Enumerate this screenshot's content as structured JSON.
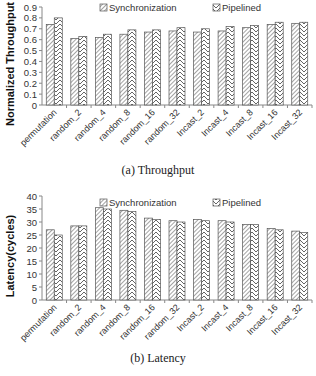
{
  "chart_data": [
    {
      "type": "bar",
      "title": "",
      "caption": "(a) Throughput",
      "xlabel": "",
      "ylabel": "Normalized Throughput",
      "ylim": [
        0,
        0.9
      ],
      "yticks": [
        0,
        0.1,
        0.2,
        0.3,
        0.4,
        0.5,
        0.6,
        0.7,
        0.8,
        0.9
      ],
      "ytick_labels": [
        "0",
        "0.1",
        "0.2",
        "0.3",
        "0.4",
        "0.5",
        "0.6",
        "0.7",
        "0.8",
        "0.9"
      ],
      "grid": false,
      "legend_position": "top",
      "categories": [
        "permutation",
        "random_2",
        "random_4",
        "random_8",
        "random_16",
        "random_32",
        "Incast_2",
        "Incast_4",
        "Incast_8",
        "Incast_16",
        "Incast_32"
      ],
      "series": [
        {
          "name": "Synchronization",
          "pattern": "diagonal",
          "values": [
            0.74,
            0.61,
            0.62,
            0.65,
            0.67,
            0.68,
            0.67,
            0.68,
            0.71,
            0.74,
            0.75
          ]
        },
        {
          "name": "Pipelined",
          "pattern": "chevron",
          "values": [
            0.8,
            0.63,
            0.65,
            0.69,
            0.69,
            0.71,
            0.7,
            0.72,
            0.73,
            0.76,
            0.76
          ]
        }
      ]
    },
    {
      "type": "bar",
      "title": "",
      "caption": "(b) Latency",
      "xlabel": "",
      "ylabel": "Latency(cycles)",
      "ylim": [
        0,
        40
      ],
      "yticks": [
        0,
        5,
        10,
        15,
        20,
        25,
        30,
        35,
        40
      ],
      "ytick_labels": [
        "0",
        "5",
        "10",
        "15",
        "20",
        "25",
        "30",
        "35",
        "40"
      ],
      "grid": false,
      "legend_position": "top",
      "categories": [
        "permutation",
        "random_2",
        "random_4",
        "random_8",
        "random_16",
        "random_32",
        "Incast_2",
        "Incast_4",
        "Incast_8",
        "Incast_16",
        "Incast_32"
      ],
      "series": [
        {
          "name": "Synchronization",
          "pattern": "diagonal",
          "values": [
            27,
            28.5,
            35.5,
            34.5,
            31.5,
            30.5,
            31,
            30.5,
            29,
            27.5,
            26.5
          ]
        },
        {
          "name": "Pipelined",
          "pattern": "chevron",
          "values": [
            25,
            28.5,
            35,
            34,
            31,
            30,
            30.5,
            30,
            29,
            27,
            26
          ]
        }
      ]
    }
  ],
  "colors": {
    "bar_stroke": "#555555",
    "hatch": "#666666",
    "axis": "#888888",
    "background": "#ffffff"
  }
}
